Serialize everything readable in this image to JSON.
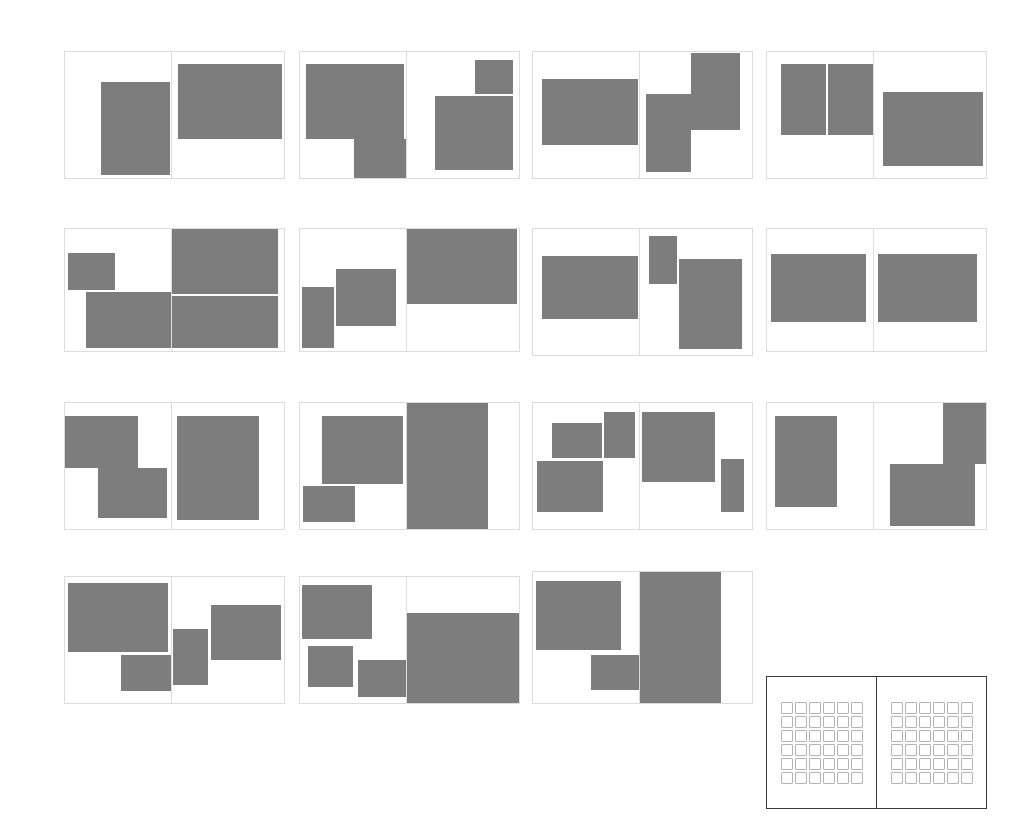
{
  "canvas": {
    "width": 1023,
    "height": 828,
    "background": "#ffffff",
    "block_color": "#7d7d7d",
    "frame_color": "#dcdcdc",
    "swatch_frame_color": "#3a3a3a",
    "swatch_cell_border": "#b4b4b4"
  },
  "spreads": [
    {
      "name": "spread-r1c1",
      "x": 64,
      "y": 51,
      "w": 221,
      "h": 128,
      "gutter": 107,
      "left_blocks": [
        {
          "x": 36,
          "y": 30,
          "w": 69,
          "h": 93
        }
      ],
      "right_blocks": [
        {
          "x": 6,
          "y": 12,
          "w": 104,
          "h": 75
        }
      ]
    },
    {
      "name": "spread-r1c2",
      "x": 299,
      "y": 51,
      "w": 221,
      "h": 128,
      "gutter": 107,
      "left_blocks": [
        {
          "x": 6,
          "y": 12,
          "w": 98,
          "h": 75
        },
        {
          "x": 54,
          "y": 87,
          "w": 53,
          "h": 49
        }
      ],
      "right_blocks": [
        {
          "x": 68,
          "y": 8,
          "w": 38,
          "h": 34
        },
        {
          "x": 28,
          "y": 44,
          "w": 78,
          "h": 74
        }
      ]
    },
    {
      "name": "spread-r1c3",
      "x": 532,
      "y": 51,
      "w": 221,
      "h": 128,
      "gutter": 107,
      "left_blocks": [
        {
          "x": 9,
          "y": 27,
          "w": 96,
          "h": 66
        }
      ],
      "right_blocks": [
        {
          "x": 6,
          "y": 42,
          "w": 45,
          "h": 78
        },
        {
          "x": 51,
          "y": 1,
          "w": 49,
          "h": 77
        }
      ]
    },
    {
      "name": "spread-r1c4",
      "x": 766,
      "y": 51,
      "w": 221,
      "h": 128,
      "gutter": 107,
      "left_blocks": [
        {
          "x": 14,
          "y": 12,
          "w": 45,
          "h": 71
        },
        {
          "x": 61,
          "y": 12,
          "w": 45,
          "h": 71
        }
      ],
      "right_blocks": [
        {
          "x": 9,
          "y": 40,
          "w": 100,
          "h": 74
        }
      ]
    },
    {
      "name": "spread-r2c1",
      "x": 64,
      "y": 228,
      "w": 221,
      "h": 124,
      "gutter": 107,
      "left_blocks": [
        {
          "x": 3,
          "y": 24,
          "w": 47,
          "h": 37
        },
        {
          "x": 21,
          "y": 63,
          "w": 85,
          "h": 56
        }
      ],
      "right_blocks": [
        {
          "x": 0,
          "y": 0,
          "w": 106,
          "h": 65
        },
        {
          "x": 0,
          "y": 67,
          "w": 106,
          "h": 52
        }
      ]
    },
    {
      "name": "spread-r2c2",
      "x": 299,
      "y": 228,
      "w": 221,
      "h": 124,
      "gutter": 107,
      "left_blocks": [
        {
          "x": 2,
          "y": 58,
          "w": 32,
          "h": 61
        },
        {
          "x": 36,
          "y": 40,
          "w": 60,
          "h": 57
        }
      ],
      "right_blocks": [
        {
          "x": 0,
          "y": 0,
          "w": 110,
          "h": 75
        }
      ]
    },
    {
      "name": "spread-r2c3",
      "x": 532,
      "y": 228,
      "w": 221,
      "h": 128,
      "gutter": 107,
      "left_blocks": [
        {
          "x": 9,
          "y": 27,
          "w": 96,
          "h": 63
        }
      ],
      "right_blocks": [
        {
          "x": 9,
          "y": 7,
          "w": 28,
          "h": 48
        },
        {
          "x": 39,
          "y": 30,
          "w": 63,
          "h": 90
        }
      ]
    },
    {
      "name": "spread-r2c4",
      "x": 766,
      "y": 228,
      "w": 221,
      "h": 124,
      "gutter": 107,
      "left_blocks": [
        {
          "x": 4,
          "y": 25,
          "w": 95,
          "h": 68
        }
      ],
      "right_blocks": [
        {
          "x": 4,
          "y": 25,
          "w": 99,
          "h": 68
        }
      ]
    },
    {
      "name": "spread-r3c1",
      "x": 64,
      "y": 402,
      "w": 221,
      "h": 128,
      "gutter": 107,
      "left_blocks": [
        {
          "x": -2,
          "y": 13,
          "w": 75,
          "h": 52
        },
        {
          "x": 33,
          "y": 65,
          "w": 69,
          "h": 50
        }
      ],
      "right_blocks": [
        {
          "x": 5,
          "y": 13,
          "w": 82,
          "h": 104
        }
      ]
    },
    {
      "name": "spread-r3c2",
      "x": 299,
      "y": 402,
      "w": 221,
      "h": 128,
      "gutter": 107,
      "left_blocks": [
        {
          "x": 22,
          "y": 13,
          "w": 81,
          "h": 68
        },
        {
          "x": 3,
          "y": 83,
          "w": 52,
          "h": 36
        }
      ],
      "right_blocks": [
        {
          "x": 0,
          "y": 0,
          "w": 81,
          "h": 128
        }
      ]
    },
    {
      "name": "spread-r3c3",
      "x": 532,
      "y": 402,
      "w": 221,
      "h": 128,
      "gutter": 107,
      "left_blocks": [
        {
          "x": 19,
          "y": 20,
          "w": 50,
          "h": 35
        },
        {
          "x": 71,
          "y": 9,
          "w": 31,
          "h": 46
        },
        {
          "x": 4,
          "y": 58,
          "w": 66,
          "h": 51
        }
      ],
      "right_blocks": [
        {
          "x": 2,
          "y": 9,
          "w": 73,
          "h": 70
        },
        {
          "x": 81,
          "y": 56,
          "w": 23,
          "h": 53
        }
      ]
    },
    {
      "name": "spread-r3c4",
      "x": 766,
      "y": 402,
      "w": 221,
      "h": 128,
      "gutter": 107,
      "left_blocks": [
        {
          "x": 8,
          "y": 13,
          "w": 62,
          "h": 91
        }
      ],
      "right_blocks": [
        {
          "x": 69,
          "y": -2,
          "w": 46,
          "h": 63
        },
        {
          "x": 16,
          "y": 61,
          "w": 85,
          "h": 62
        }
      ]
    },
    {
      "name": "spread-r4c1",
      "x": 64,
      "y": 576,
      "w": 221,
      "h": 128,
      "gutter": 107,
      "left_blocks": [
        {
          "x": 3,
          "y": 6,
          "w": 100,
          "h": 69
        },
        {
          "x": 56,
          "y": 78,
          "w": 51,
          "h": 36
        }
      ],
      "right_blocks": [
        {
          "x": 1,
          "y": 52,
          "w": 35,
          "h": 56
        },
        {
          "x": 39,
          "y": 28,
          "w": 70,
          "h": 55
        }
      ]
    },
    {
      "name": "spread-r4c2",
      "x": 299,
      "y": 576,
      "w": 221,
      "h": 128,
      "gutter": 107,
      "left_blocks": [
        {
          "x": 2,
          "y": 8,
          "w": 70,
          "h": 54
        },
        {
          "x": 8,
          "y": 69,
          "w": 45,
          "h": 41
        },
        {
          "x": 58,
          "y": 83,
          "w": 48,
          "h": 37
        }
      ],
      "right_blocks": [
        {
          "x": 0,
          "y": 36,
          "w": 113,
          "h": 92
        }
      ]
    },
    {
      "name": "spread-r4c3",
      "x": 532,
      "y": 571,
      "w": 221,
      "h": 133,
      "gutter": 107,
      "left_blocks": [
        {
          "x": 3,
          "y": 9,
          "w": 85,
          "h": 69
        },
        {
          "x": 58,
          "y": 83,
          "w": 48,
          "h": 35
        }
      ],
      "right_blocks": [
        {
          "x": 0,
          "y": 0,
          "w": 81,
          "h": 133
        }
      ]
    }
  ],
  "swatch_panel": {
    "name": "swatch-grid-panel",
    "x": 766,
    "y": 676,
    "w": 221,
    "h": 133,
    "gutter": 110,
    "rows": 6,
    "cols": 6,
    "cell_count_per_half": 36,
    "total_cells": 72
  }
}
